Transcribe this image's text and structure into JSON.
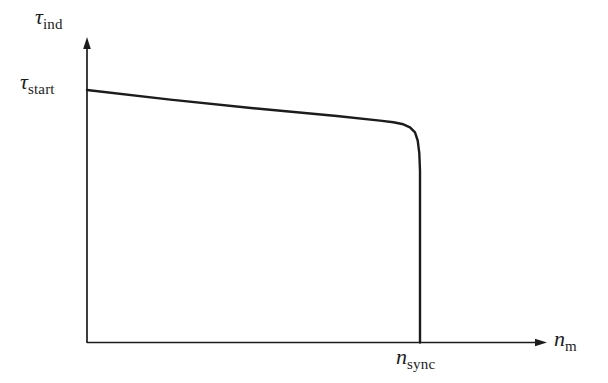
{
  "colors": {
    "curve": "#1c1c1c",
    "axis": "#1c1c1c",
    "text": "#1c1c1c",
    "background": "#ffffff"
  },
  "labels": {
    "y_axis": {
      "symbol": "τ",
      "subscript": "ind"
    },
    "y_value": {
      "symbol": "τ",
      "subscript": "start"
    },
    "x_axis": {
      "symbol": "n",
      "subscript": "m"
    },
    "x_value": {
      "symbol": "n",
      "subscript": "sync"
    }
  },
  "chart_data": {
    "type": "line",
    "title": "",
    "xlabel": "n_m",
    "ylabel": "τ_ind",
    "x_annotation": "n_sync",
    "y_annotation": "τ_start",
    "grid": false,
    "legend": false,
    "axis_arrows": true,
    "x_range_normalized": [
      0,
      1
    ],
    "y_range_normalized": [
      0,
      1
    ],
    "series": [
      {
        "name": "torque-speed characteristic",
        "points_normalized": [
          [
            0.0,
            1.0
          ],
          [
            0.25,
            0.962
          ],
          [
            0.5,
            0.928
          ],
          [
            0.75,
            0.897
          ],
          [
            0.88,
            0.879
          ],
          [
            0.92,
            0.872
          ],
          [
            0.95,
            0.864
          ],
          [
            0.97,
            0.852
          ],
          [
            0.985,
            0.832
          ],
          [
            0.993,
            0.8
          ],
          [
            0.998,
            0.75
          ],
          [
            1.0,
            0.68
          ],
          [
            1.0,
            0.0
          ]
        ]
      }
    ]
  }
}
